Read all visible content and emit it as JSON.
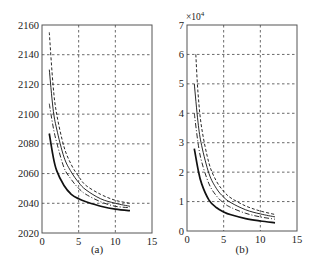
{
  "chart_data": [
    {
      "type": "line",
      "caption": "(a)",
      "title": "",
      "xlabel": "",
      "ylabel": "",
      "xlim": [
        0,
        15
      ],
      "ylim": [
        2020,
        2160
      ],
      "xticks": [
        0,
        5,
        10,
        15
      ],
      "yticks": [
        2020,
        2040,
        2060,
        2080,
        2100,
        2120,
        2140,
        2160
      ],
      "grid": true,
      "series": [
        {
          "name": "dashed",
          "style": "dashed",
          "x": [
            1,
            1.5,
            2,
            3,
            4,
            5,
            6,
            8,
            10,
            12
          ],
          "values": [
            2155,
            2120,
            2100,
            2078,
            2066,
            2058,
            2052,
            2046,
            2042,
            2040
          ]
        },
        {
          "name": "thin-solid",
          "style": "solid-thin",
          "x": [
            1,
            1.5,
            2,
            3,
            4,
            5,
            6,
            8,
            10,
            12
          ],
          "values": [
            2130,
            2104,
            2090,
            2071,
            2061,
            2054,
            2049,
            2043,
            2040,
            2038
          ]
        },
        {
          "name": "dash-dot",
          "style": "dashdot",
          "x": [
            1,
            1.5,
            2,
            3,
            4,
            5,
            6,
            8,
            10,
            12
          ],
          "values": [
            2107,
            2092,
            2081,
            2064,
            2056,
            2050,
            2046,
            2041,
            2038,
            2037
          ]
        },
        {
          "name": "thick-solid",
          "style": "solid-thick",
          "x": [
            1,
            1.5,
            2,
            3,
            4,
            5,
            6,
            8,
            10,
            12
          ],
          "values": [
            2087,
            2072,
            2062,
            2052,
            2046,
            2043,
            2041,
            2038,
            2036,
            2035
          ]
        }
      ]
    },
    {
      "type": "line",
      "caption": "(b)",
      "title": "",
      "xlabel": "",
      "ylabel": "",
      "y_multiplier": "×10^4",
      "xlim": [
        0,
        15
      ],
      "ylim": [
        0,
        7
      ],
      "xticks": [
        0,
        5,
        10,
        15
      ],
      "yticks": [
        0,
        1,
        2,
        3,
        4,
        5,
        6,
        7
      ],
      "grid": true,
      "series": [
        {
          "name": "dashed",
          "style": "dashed",
          "x": [
            1.2,
            1.5,
            2,
            3,
            4,
            5,
            6,
            8,
            10,
            12
          ],
          "values": [
            6.0,
            4.7,
            3.5,
            2.3,
            1.7,
            1.35,
            1.12,
            0.85,
            0.68,
            0.56
          ]
        },
        {
          "name": "thin-solid",
          "style": "solid-thin",
          "x": [
            1,
            1.5,
            2,
            3,
            4,
            5,
            6,
            8,
            10,
            12
          ],
          "values": [
            5.0,
            3.7,
            2.9,
            1.95,
            1.45,
            1.15,
            0.96,
            0.72,
            0.58,
            0.48
          ]
        },
        {
          "name": "dash-dot",
          "style": "dashdot",
          "x": [
            1,
            1.5,
            2,
            3,
            4,
            5,
            6,
            8,
            10,
            12
          ],
          "values": [
            4.0,
            3.0,
            2.35,
            1.6,
            1.2,
            0.95,
            0.8,
            0.6,
            0.48,
            0.4
          ]
        },
        {
          "name": "thick-solid",
          "style": "solid-thick",
          "x": [
            1,
            1.5,
            2,
            3,
            4,
            5,
            6,
            8,
            10,
            12
          ],
          "values": [
            2.8,
            2.1,
            1.6,
            1.05,
            0.8,
            0.65,
            0.55,
            0.42,
            0.34,
            0.28
          ]
        }
      ]
    }
  ],
  "panels": [
    {
      "caption": "(a)",
      "xticks": [
        "0",
        "5",
        "10",
        "15"
      ],
      "yticks": [
        "2020",
        "2040",
        "2060",
        "2080",
        "2100",
        "2120",
        "2140",
        "2160"
      ]
    },
    {
      "caption": "(b)",
      "multiplier_base": "×10",
      "multiplier_exp": "4",
      "xticks": [
        "0",
        "5",
        "10",
        "15"
      ],
      "yticks": [
        "0",
        "1",
        "2",
        "3",
        "4",
        "5",
        "6",
        "7"
      ]
    }
  ]
}
